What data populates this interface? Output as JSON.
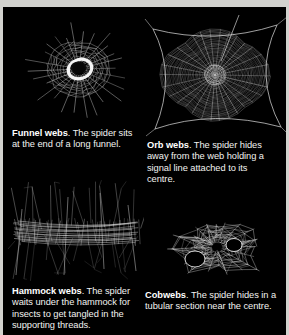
{
  "page": {
    "background_color": "#d2d2ce",
    "panel_color": "#000000",
    "text_color": "#f2f2f0",
    "web_color": "#ffffff"
  },
  "figures": [
    {
      "id": "funnel-web",
      "icon": "funnel-web-illustration",
      "title": "Funnel webs",
      "body": ". The spider sits at the end of a long funnel."
    },
    {
      "id": "orb-web",
      "icon": "orb-web-illustration",
      "title": "Orb webs",
      "body": ". The spider hides away from the web holding a signal line attached to its centre."
    },
    {
      "id": "hammock-web",
      "icon": "hammock-web-illustration",
      "title": "Hammock webs",
      "body": ". The spider waits under the hammock for insects to get tangled in the supporting threads."
    },
    {
      "id": "cobweb",
      "icon": "cobweb-illustration",
      "title": "Cobwebs",
      "body": ". The spider hides in a tubular section near the centre."
    }
  ]
}
